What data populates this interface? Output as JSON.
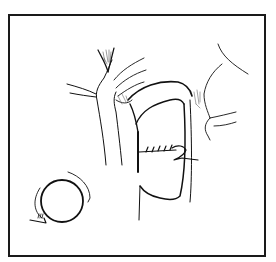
{
  "figure": {
    "ink_color": "#111111",
    "background": "#ffffff",
    "frame_color": "#1a1a1a",
    "inset": {
      "shape": "circle-with-rotation-arrow"
    }
  }
}
